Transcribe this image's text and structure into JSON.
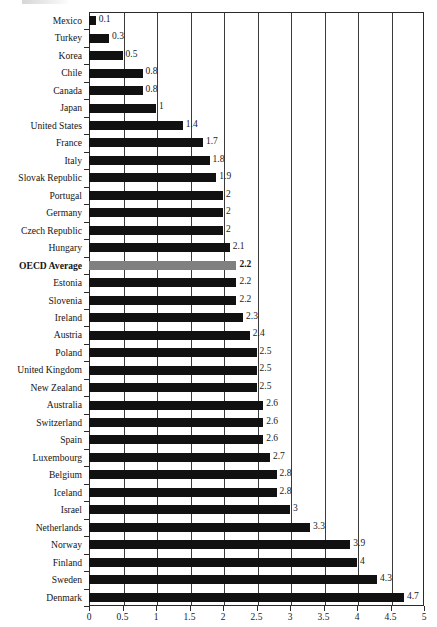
{
  "chart_data": {
    "type": "bar",
    "orientation": "horizontal",
    "title": "",
    "subtitle": "",
    "xlabel": "",
    "ylabel": "",
    "xlim": [
      0,
      5
    ],
    "xticks": [
      0,
      0.5,
      1,
      1.5,
      2,
      2.5,
      3,
      3.5,
      4,
      4.5,
      5
    ],
    "xtick_labels": [
      "0",
      "0.5",
      "1",
      "1.5",
      "2",
      "2.5",
      "3",
      "3.5",
      "4",
      "4.5",
      "5"
    ],
    "grid": "vertical",
    "legend": "none",
    "categories": [
      "Mexico",
      "Turkey",
      "Korea",
      "Chile",
      "Canada",
      "Japan",
      "United States",
      "France",
      "Italy",
      "Slovak Republic",
      "Portugal",
      "Germany",
      "Czech Republic",
      "Hungary",
      "OECD Average",
      "Estonia",
      "Slovenia",
      "Ireland",
      "Austria",
      "Poland",
      "United Kingdom",
      "New Zealand",
      "Australia",
      "Switzerland",
      "Spain",
      "Luxembourg",
      "Belgium",
      "Iceland",
      "Israel",
      "Netherlands",
      "Norway",
      "Finland",
      "Sweden",
      "Denmark"
    ],
    "values": [
      0.1,
      0.3,
      0.5,
      0.8,
      0.8,
      1,
      1.4,
      1.7,
      1.8,
      1.9,
      2,
      2,
      2,
      2.1,
      2.2,
      2.2,
      2.2,
      2.3,
      2.4,
      2.5,
      2.5,
      2.5,
      2.6,
      2.6,
      2.6,
      2.7,
      2.8,
      2.8,
      3,
      3.3,
      3.9,
      4,
      4.3,
      4.7
    ],
    "value_labels": [
      "0.1",
      "0.3",
      "0.5",
      "0.8",
      "0.8",
      "1",
      "1.4",
      "1.7",
      "1.8",
      "1.9",
      "2",
      "2",
      "2",
      "2.1",
      "2.2",
      "2.2",
      "2.2",
      "2.3",
      "2.4",
      "2.5",
      "2.5",
      "2.5",
      "2.6",
      "2.6",
      "2.6",
      "2.7",
      "2.8",
      "2.8",
      "3",
      "3.3",
      "3.9",
      "4",
      "4.3",
      "4.7"
    ],
    "highlight_index": 14,
    "highlight_label": "OECD Average",
    "colors": {
      "bar": "#111111",
      "highlight_bar": "#808080",
      "axis": "#2a2a2a",
      "grid": "#3a3a3a",
      "text": "#141414",
      "background": "#ffffff"
    }
  }
}
